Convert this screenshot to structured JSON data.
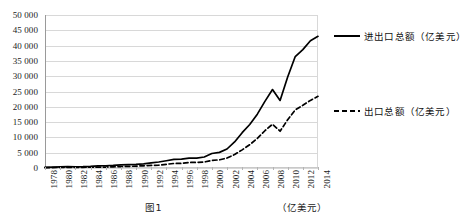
{
  "chart_data": {
    "type": "line",
    "title": "",
    "xlabel": "",
    "ylabel": "",
    "ylim": [
      0,
      50000
    ],
    "ytick_step": 5000,
    "grid": true,
    "legend_position": "right",
    "y_ticks": [
      "0",
      "5 000",
      "10 000",
      "15 000",
      "20 000",
      "25 000",
      "30 000",
      "35 000",
      "40 000",
      "45 000",
      "50 000"
    ],
    "x": [
      1978,
      1979,
      1980,
      1981,
      1982,
      1983,
      1984,
      1985,
      1986,
      1987,
      1988,
      1989,
      1990,
      1991,
      1992,
      1993,
      1994,
      1995,
      1996,
      1997,
      1998,
      1999,
      2000,
      2001,
      2002,
      2003,
      2004,
      2005,
      2006,
      2007,
      2008,
      2009,
      2010,
      2011,
      2012,
      2013,
      2014
    ],
    "x_tick_labels": [
      "1978",
      "1980",
      "1982",
      "1984",
      "1986",
      "1988",
      "1990",
      "1992",
      "1994",
      "1996",
      "1998",
      "2000",
      "2002",
      "2004",
      "2006",
      "2008",
      "2010",
      "2012",
      "2014"
    ],
    "series": [
      {
        "name": "进出口总额（亿美元）",
        "style": "solid",
        "color": "#000000",
        "values": [
          206,
          293,
          378,
          440,
          416,
          436,
          535,
          696,
          738,
          827,
          1028,
          1117,
          1154,
          1357,
          1656,
          1957,
          2366,
          2808,
          2899,
          3252,
          3240,
          3606,
          4743,
          5098,
          6208,
          8510,
          11546,
          14219,
          17604,
          21766,
          25633,
          22072,
          29740,
          36419,
          38671,
          41590,
          43030
        ]
      },
      {
        "name": "出口总额（亿美元）",
        "style": "dashed",
        "color": "#000000",
        "values": [
          98,
          137,
          181,
          220,
          223,
          222,
          261,
          274,
          309,
          394,
          475,
          525,
          621,
          719,
          849,
          917,
          1210,
          1488,
          1511,
          1828,
          1838,
          1949,
          2492,
          2661,
          3256,
          4382,
          5933,
          7620,
          9690,
          12180,
          14307,
          12016,
          15778,
          18984,
          20489,
          22090,
          23423
        ]
      }
    ]
  },
  "legend": {
    "entries": [
      {
        "label": "进出口总额（亿美元）",
        "style": "solid"
      },
      {
        "label": "出口总额（亿美元）",
        "style": "dashed"
      }
    ]
  },
  "caption": {
    "text": "图1　　　　　　　　　　　　（亿美元）"
  }
}
